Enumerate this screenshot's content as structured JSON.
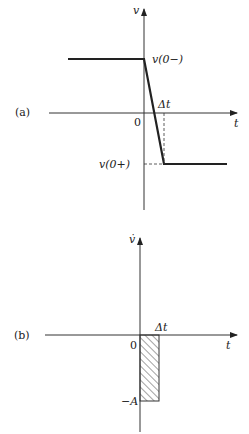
{
  "diagram_a": {
    "panel_label": "(a)",
    "y_axis_label": "v",
    "x_axis_label": "t",
    "origin_label": "0",
    "delta_label": "Δt",
    "upper_level_label": "v(0−)",
    "lower_level_label": "v(0+)"
  },
  "diagram_b": {
    "panel_label": "(b)",
    "y_axis_label": "v̇",
    "x_axis_label": "t",
    "origin_label": "0",
    "delta_label": "Δt",
    "pulse_level_label": "−A"
  },
  "colors": {
    "line": "#222222",
    "axis": "#333333"
  }
}
